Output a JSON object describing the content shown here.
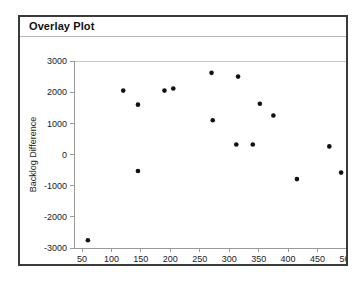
{
  "window": {
    "title": "Overlay Plot"
  },
  "chart_data": {
    "type": "scatter",
    "title": "Overlay Plot",
    "xlabel": "Beds",
    "ylabel": "Backlog Difference",
    "xlim": [
      35,
      515
    ],
    "ylim": [
      -3200,
      3100
    ],
    "xticks": [
      50,
      100,
      150,
      200,
      250,
      300,
      350,
      400,
      450,
      500
    ],
    "yticks": [
      3000,
      2000,
      1000,
      0,
      -1000,
      -2000,
      -3000
    ],
    "xtick_labels": [
      "50",
      "100",
      "150",
      "200",
      "250",
      "300",
      "350",
      "400",
      "450",
      "500"
    ],
    "ytick_labels": [
      "3000",
      "2000",
      "1000",
      "0",
      "-1000",
      "-2000",
      "-3000"
    ],
    "grid": false,
    "legend": null,
    "marker": "filled-circle",
    "marker_color": "#111111",
    "series": [
      {
        "name": "Backlog Difference",
        "points": [
          {
            "x": 60,
            "y": -2750
          },
          {
            "x": 120,
            "y": 2050
          },
          {
            "x": 145,
            "y": 1600
          },
          {
            "x": 145,
            "y": -530
          },
          {
            "x": 190,
            "y": 2050
          },
          {
            "x": 205,
            "y": 2120
          },
          {
            "x": 270,
            "y": 2620
          },
          {
            "x": 272,
            "y": 1100
          },
          {
            "x": 315,
            "y": 2500
          },
          {
            "x": 312,
            "y": 320
          },
          {
            "x": 340,
            "y": 320
          },
          {
            "x": 352,
            "y": 1630
          },
          {
            "x": 375,
            "y": 1250
          },
          {
            "x": 415,
            "y": -790
          },
          {
            "x": 470,
            "y": 260
          },
          {
            "x": 490,
            "y": -580
          }
        ]
      }
    ]
  }
}
